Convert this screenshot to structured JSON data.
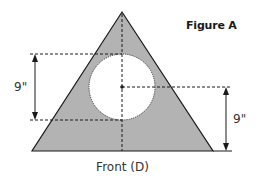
{
  "figure": {
    "title": "Figure A",
    "caption": "Front (D)",
    "dimensions": [
      {
        "label": "9\"",
        "side": "left",
        "description": "circle diameter"
      },
      {
        "label": "9\"",
        "side": "right",
        "description": "circle center to base"
      }
    ],
    "colors": {
      "triangle_fill": "#b3b3b3",
      "circle_fill": "#ffffff",
      "stroke": "#1a1a1a"
    }
  }
}
